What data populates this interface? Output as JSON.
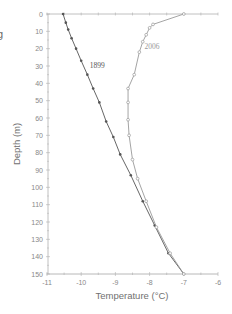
{
  "edge_fragment": "g",
  "chart_data": {
    "type": "line",
    "title": "",
    "xlabel": "Temperature (°C)",
    "ylabel": "Depth (m)",
    "xlim": [
      -11,
      -6
    ],
    "ylim": [
      150,
      0
    ],
    "y_inverted": true,
    "x_ticks": [
      "-11",
      "-10",
      "-9",
      "-8",
      "-7",
      "-6"
    ],
    "y_ticks": [
      "0",
      "10",
      "20",
      "30",
      "40",
      "50",
      "60",
      "70",
      "80",
      "90",
      "100",
      "110",
      "120",
      "130",
      "140",
      "150"
    ],
    "grid": false,
    "legend": "inline labels",
    "series": [
      {
        "name": "1899",
        "color": "#555555",
        "marker": "filled-circle",
        "points": [
          [
            -10.53,
            0
          ],
          [
            -10.45,
            5
          ],
          [
            -10.38,
            9
          ],
          [
            -10.28,
            14
          ],
          [
            -10.15,
            20
          ],
          [
            -10.0,
            27
          ],
          [
            -9.82,
            35
          ],
          [
            -9.65,
            43
          ],
          [
            -9.47,
            51
          ],
          [
            -9.27,
            62
          ],
          [
            -9.06,
            71
          ],
          [
            -8.86,
            81
          ],
          [
            -8.55,
            93
          ],
          [
            -8.2,
            108
          ],
          [
            -7.85,
            122
          ],
          [
            -7.45,
            138
          ],
          [
            -7.0,
            150
          ]
        ]
      },
      {
        "name": "2006",
        "color": "#9a9a9a",
        "marker": "open-circle",
        "points": [
          [
            -7.0,
            0
          ],
          [
            -7.9,
            6
          ],
          [
            -8.0,
            8
          ],
          [
            -8.1,
            12
          ],
          [
            -8.2,
            16
          ],
          [
            -8.3,
            22
          ],
          [
            -8.45,
            35
          ],
          [
            -8.63,
            43
          ],
          [
            -8.63,
            51
          ],
          [
            -8.63,
            61
          ],
          [
            -8.6,
            70
          ],
          [
            -8.5,
            84
          ],
          [
            -8.35,
            95
          ],
          [
            -8.1,
            108
          ],
          [
            -7.8,
            123
          ],
          [
            -7.4,
            138
          ],
          [
            -7.0,
            150
          ]
        ]
      }
    ],
    "annotations": [
      {
        "text": "1899",
        "x": -9.75,
        "y": 31
      },
      {
        "text": "2006",
        "x": -8.15,
        "y": 20
      }
    ]
  }
}
